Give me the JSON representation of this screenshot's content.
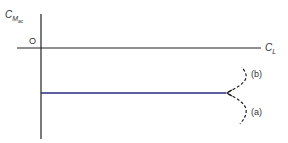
{
  "diagram": {
    "y_axis_label": "C",
    "y_axis_subscript": "M",
    "y_axis_subsubscript": "ac",
    "origin_label": "O",
    "x_axis_label": "C",
    "x_axis_subscript": "L",
    "branch_b_label": "(b)",
    "branch_a_label": "(a)",
    "colors": {
      "axis": "#222222",
      "curve": "#2a2a80"
    }
  }
}
